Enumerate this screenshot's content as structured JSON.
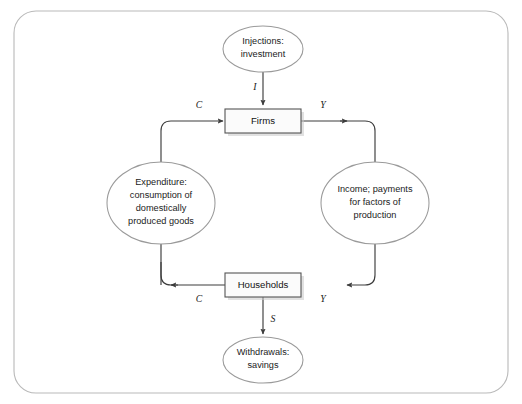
{
  "canvas": {
    "width": 522,
    "height": 404,
    "background": "#ffffff",
    "frame": {
      "stroke": "#b9b9b9",
      "x": 14,
      "y": 11,
      "width": 494,
      "height": 382,
      "radius": 22
    }
  },
  "theme": {
    "line_color": "#3d3d3d",
    "ellipse_stroke": "#9a9a9a",
    "box_stroke": "#555555",
    "box_fill": "#fbfbfb",
    "text_color": "#1b1b1b"
  },
  "diagram": {
    "type": "circular-flow",
    "boxes": [
      {
        "id": "firms",
        "label": "Firms",
        "cx": 263,
        "cy": 121,
        "width": 76,
        "height": 24
      },
      {
        "id": "households",
        "label": "Households",
        "cx": 263,
        "cy": 285,
        "width": 76,
        "height": 24
      }
    ],
    "ellipses": [
      {
        "id": "injections",
        "cx": 263,
        "cy": 49,
        "rx": 40,
        "ry": 23,
        "lines": [
          "Injections:",
          "investment"
        ]
      },
      {
        "id": "expenditure",
        "cx": 161,
        "cy": 203,
        "rx": 54,
        "ry": 41,
        "lines": [
          "Expenditure:",
          "consumption of",
          "domestically",
          "produced goods"
        ]
      },
      {
        "id": "income",
        "cx": 375,
        "cy": 203,
        "rx": 54,
        "ry": 41,
        "lines": [
          "Income; payments",
          "for factors of",
          "production"
        ]
      },
      {
        "id": "withdrawals",
        "cx": 263,
        "cy": 360,
        "rx": 40,
        "ry": 23,
        "lines": [
          "Withdrawals:",
          "savings"
        ]
      }
    ],
    "flow_labels": [
      {
        "id": "injection-I",
        "text": "I",
        "x": 255,
        "y": 88
      },
      {
        "id": "expenditure-top-C",
        "text": "C",
        "x": 199,
        "y": 106
      },
      {
        "id": "income-top-Y",
        "text": "Y",
        "x": 323,
        "y": 106
      },
      {
        "id": "expenditure-bottom-C",
        "text": "C",
        "x": 199,
        "y": 300
      },
      {
        "id": "income-bottom-Y",
        "text": "Y",
        "x": 323,
        "y": 300
      },
      {
        "id": "withdrawal-S",
        "text": "S",
        "x": 273,
        "y": 320
      }
    ]
  }
}
